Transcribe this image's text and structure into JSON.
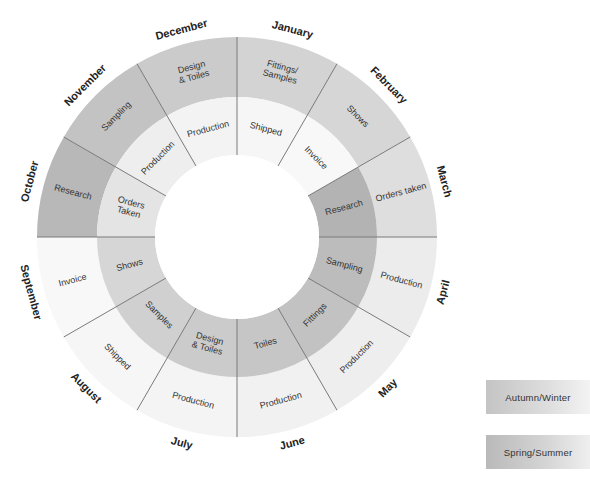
{
  "diagram": {
    "type": "radial-calendar-wheel",
    "center": [
      237,
      237
    ],
    "radii": {
      "hole": 82,
      "inner_ring_outer": 140,
      "outer_ring_outer": 200,
      "month_label": 214
    },
    "months": [
      "January",
      "February",
      "March",
      "April",
      "May",
      "June",
      "July",
      "August",
      "September",
      "October",
      "November",
      "December"
    ],
    "outer_ring": [
      {
        "month": "January",
        "label": "Fittings/\nSamples",
        "shade": "#d3d3d3"
      },
      {
        "month": "February",
        "label": "Shows",
        "shade": "#d6d6d6"
      },
      {
        "month": "March",
        "label": "Orders taken",
        "shade": "#dedede"
      },
      {
        "month": "April",
        "label": "Production",
        "shade": "#ececec"
      },
      {
        "month": "May",
        "label": "Production",
        "shade": "#eeeeee"
      },
      {
        "month": "June",
        "label": "Production",
        "shade": "#f1f1f1"
      },
      {
        "month": "July",
        "label": "Production",
        "shade": "#f4f4f4"
      },
      {
        "month": "August",
        "label": "Shipped",
        "shade": "#f6f6f6"
      },
      {
        "month": "September",
        "label": "Invoice",
        "shade": "#f8f8f8"
      },
      {
        "month": "October",
        "label": "Research",
        "shade": "#b8b8b8"
      },
      {
        "month": "November",
        "label": "Sampling",
        "shade": "#c3c3c3"
      },
      {
        "month": "December",
        "label": "Design\n& Toiles",
        "shade": "#cbcbcb"
      }
    ],
    "inner_ring": [
      {
        "month": "January",
        "label": "Shipped",
        "shade": "#f6f6f6"
      },
      {
        "month": "February",
        "label": "Invoice",
        "shade": "#f8f8f8"
      },
      {
        "month": "March",
        "label": "Research",
        "shade": "#b3b3b3"
      },
      {
        "month": "April",
        "label": "Sampling",
        "shade": "#bcbcbc"
      },
      {
        "month": "May",
        "label": "Fittings",
        "shade": "#c2c2c2"
      },
      {
        "month": "June",
        "label": "Toiles",
        "shade": "#c6c6c6"
      },
      {
        "month": "July",
        "label": "Design\n& Toiles",
        "shade": "#cbcbcb"
      },
      {
        "month": "August",
        "label": "Samples",
        "shade": "#d0d0d0"
      },
      {
        "month": "September",
        "label": "Shows",
        "shade": "#d6d6d6"
      },
      {
        "month": "October",
        "label": "Orders\nTaken",
        "shade": "#e4e4e4"
      },
      {
        "month": "November",
        "label": "Production",
        "shade": "#eeeeee"
      },
      {
        "month": "December",
        "label": "Production",
        "shade": "#f3f3f3"
      }
    ],
    "spoke_color": "#7a7a7a",
    "text_color": "#333333"
  },
  "legend": {
    "autumn_winter": "Autumn/Winter",
    "spring_summer": "Spring/Summer"
  }
}
